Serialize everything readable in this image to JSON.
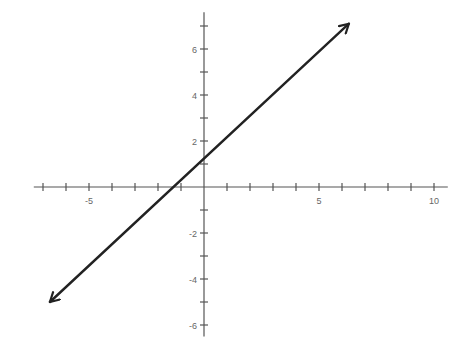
{
  "chart_data": {
    "type": "line",
    "title": "",
    "xlabel": "",
    "ylabel": "",
    "xlim": [
      -7.4,
      10.6
    ],
    "ylim": [
      -6.5,
      7.6
    ],
    "grid": false,
    "legend": null,
    "x_ticks": [
      -7,
      -6,
      -5,
      -4,
      -3,
      -2,
      -1,
      1,
      2,
      3,
      4,
      5,
      6,
      7,
      8,
      9,
      10
    ],
    "x_tick_labels": [
      {
        "value": -5,
        "label": "-5"
      },
      {
        "value": 5,
        "label": "5"
      },
      {
        "value": 10,
        "label": "10"
      }
    ],
    "y_ticks": [
      -6,
      -5,
      -4,
      -3,
      -2,
      -1,
      1,
      2,
      3,
      4,
      5,
      6,
      7
    ],
    "y_tick_labels": [
      {
        "value": 6,
        "label": "6"
      },
      {
        "value": 4,
        "label": "4"
      },
      {
        "value": 2,
        "label": "2"
      },
      {
        "value": -2,
        "label": "-2"
      },
      {
        "value": -4,
        "label": "-4"
      },
      {
        "value": -6,
        "label": "-6"
      }
    ],
    "series": [
      {
        "name": "line",
        "arrows": "both",
        "points": [
          {
            "x": -6.7,
            "y": -5.0
          },
          {
            "x": 6.3,
            "y": 7.1
          }
        ],
        "approx_equation": "y ≈ 0.93x + 1.2",
        "color": "#222222"
      }
    ]
  },
  "style": {
    "axis_color": "#555555",
    "line_color": "#222222",
    "label_color": "#666666"
  },
  "layout": {
    "origin_px": [
      204,
      187
    ],
    "unit_px": 23
  }
}
